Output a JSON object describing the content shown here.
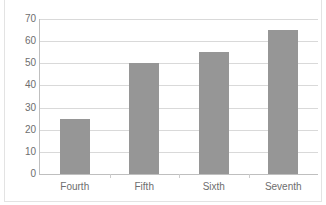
{
  "chart_data": {
    "type": "bar",
    "title": "",
    "subtitle": "",
    "xlabel": "",
    "ylabel": "",
    "categories": [
      "Fourth",
      "Fifth",
      "Sixth",
      "Seventh"
    ],
    "values": [
      25,
      50,
      55,
      65
    ],
    "series": [
      {
        "name": "Series 1",
        "values": [
          25,
          50,
          55,
          65
        ],
        "color": "#969696"
      }
    ],
    "ylim": [
      0,
      70
    ],
    "ytick_labels": [
      "0",
      "10",
      "20",
      "30",
      "40",
      "50",
      "60",
      "70"
    ],
    "ytick_values": [
      0,
      10,
      20,
      30,
      40,
      50,
      60,
      70
    ],
    "grid": true,
    "grid_axis": "y",
    "legend": false,
    "legend_position": "none",
    "bar_color": "#969696",
    "gridline_color": "#d9d9d9",
    "axis_line_color": "#bfbfbf",
    "tick_label_color": "#6e6e6e",
    "background_color": "#ffffff",
    "frame_border_color": "#e3e3e3"
  },
  "figure": {
    "clipped_title_fragment": "",
    "border_present": true
  }
}
